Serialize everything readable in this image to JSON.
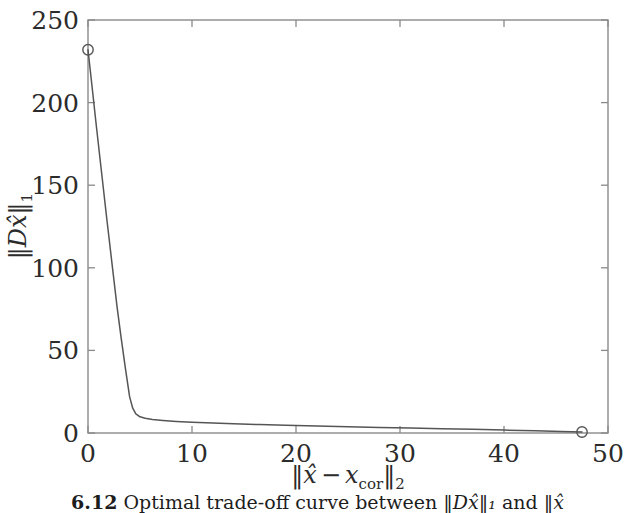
{
  "figure": {
    "caption_number": "6.12",
    "caption_text": "Optimal trade-off curve between",
    "caption_math_1": "‖Dx̂‖₁",
    "caption_conj": "and",
    "caption_math_2": "‖x̂",
    "background": "#ffffff",
    "line_color": "#555555",
    "axis_color": "#7a7a7a"
  },
  "chart_data": {
    "type": "line",
    "title": "",
    "xlabel": "‖x̂ − x_cor‖₂",
    "ylabel": "‖Dx̂‖₁",
    "xlim": [
      0,
      50
    ],
    "ylim": [
      0,
      250
    ],
    "xticks": [
      0,
      10,
      20,
      30,
      40,
      50
    ],
    "xticklabels": [
      "0",
      "10",
      "20",
      "30",
      "40",
      "50"
    ],
    "yticks": [
      0,
      50,
      100,
      150,
      200,
      250
    ],
    "yticklabels": [
      "0",
      "50",
      "100",
      "150",
      "200",
      "250"
    ],
    "grid": false,
    "legend": null,
    "frame": "box",
    "tick_direction": "in",
    "series": [
      {
        "name": "optimal trade-off curve",
        "marker": "circle-open",
        "marker_points": [
          {
            "x": 0.0,
            "y": 232.0
          },
          {
            "x": 47.5,
            "y": 0.6
          }
        ],
        "x": [
          0.0,
          0.35,
          0.8,
          1.3,
          1.8,
          2.3,
          2.8,
          3.2,
          3.6,
          4.0,
          4.3,
          4.6,
          5.0,
          5.5,
          6.2,
          7.2,
          8.5,
          10.0,
          12.0,
          14.0,
          16.5,
          19.0,
          22.0,
          25.0,
          28.0,
          31.0,
          34.0,
          37.0,
          40.0,
          43.0,
          45.5,
          47.5
        ],
        "y": [
          232.0,
          212.0,
          186.0,
          158.0,
          130.0,
          103.0,
          76.0,
          57.0,
          39.0,
          22.0,
          15.0,
          11.6,
          9.8,
          8.9,
          8.2,
          7.6,
          7.0,
          6.5,
          6.0,
          5.6,
          5.1,
          4.7,
          4.2,
          3.8,
          3.4,
          3.0,
          2.6,
          2.2,
          1.8,
          1.3,
          0.9,
          0.6
        ]
      }
    ]
  },
  "axis_text": {
    "y_norm_open": "‖",
    "y_D": "D",
    "y_xhat": "x̂",
    "y_norm_close": "‖",
    "y_sub": "1",
    "x_norm_open": "‖",
    "x_xhat": "x̂",
    "x_minus": "−",
    "x_var": "x",
    "x_var_sub": "cor",
    "x_norm_close": "‖",
    "x_sub": "2"
  }
}
